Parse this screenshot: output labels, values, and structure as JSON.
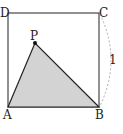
{
  "diagram": {
    "type": "geometry",
    "shape": "square",
    "vertices": {
      "A": {
        "label": "A"
      },
      "B": {
        "label": "B"
      },
      "C": {
        "label": "C"
      },
      "D": {
        "label": "D"
      },
      "P": {
        "label": "P"
      }
    },
    "side_label": "1",
    "shaded_region": "triangle ABP",
    "colors": {
      "stroke": "#222222",
      "shade": "#d3d3d3",
      "dashed_arc": "#999999"
    }
  }
}
